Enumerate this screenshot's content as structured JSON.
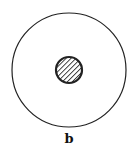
{
  "figure": {
    "label": "b",
    "outer_circle": {
      "cx": 69,
      "cy": 70,
      "r": 57,
      "stroke": "#222222",
      "fill": "none"
    },
    "inner_circle": {
      "cx": 69,
      "cy": 70,
      "r": 13,
      "stroke": "#222222",
      "fill_pattern": "diagonal-hatch"
    }
  }
}
